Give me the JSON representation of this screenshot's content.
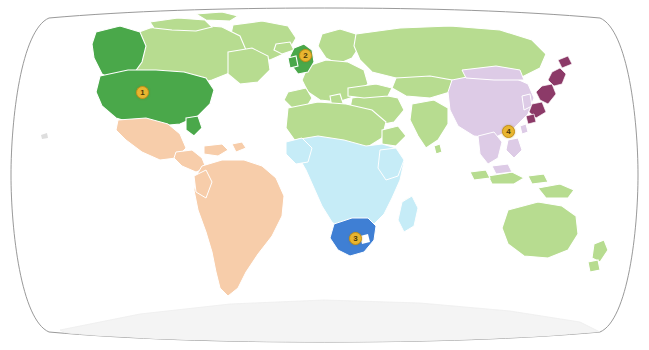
{
  "map": {
    "title": "World map with highlighted countries",
    "projection": "robinson",
    "background_color": "#ffffff",
    "graticule_outline_color": "#8d8d8d",
    "region_colors": {
      "light_green": "#b7dc90",
      "dark_green": "#4aa84a",
      "peach": "#f7cdaa",
      "light_blue": "#c6ecf7",
      "dark_blue": "#3f7fd4",
      "light_purple": "#ddcbe6",
      "dark_purple": "#8c3a68",
      "antarctica": "#f4f4f4",
      "border_color": "#ffffff"
    },
    "markers": [
      {
        "id": "marker-usa",
        "label": "1",
        "country": "United States",
        "x": 142,
        "y": 92,
        "highlight_color": "#4aa84a"
      },
      {
        "id": "marker-uk",
        "label": "2",
        "country": "United Kingdom",
        "x": 305,
        "y": 55,
        "highlight_color": "#4aa84a"
      },
      {
        "id": "marker-south-africa",
        "label": "3",
        "country": "South Africa",
        "x": 355,
        "y": 238,
        "highlight_color": "#3f7fd4"
      },
      {
        "id": "marker-philippines",
        "label": "4",
        "country": "Philippines",
        "x": 508,
        "y": 131,
        "highlight_color": "#e8b530"
      }
    ],
    "highlighted_regions": [
      {
        "name": "United States",
        "color": "#4aa84a"
      },
      {
        "name": "Canada (west)",
        "color": "#4aa84a"
      },
      {
        "name": "United Kingdom",
        "color": "#4aa84a"
      },
      {
        "name": "South Africa",
        "color": "#3f7fd4"
      },
      {
        "name": "Japan",
        "color": "#8c3a68"
      }
    ],
    "region_groups": [
      {
        "name": "Europe, Russia, North Africa, Australia, Canada east",
        "color": "#b7dc90"
      },
      {
        "name": "Latin America",
        "color": "#f7cdaa"
      },
      {
        "name": "Sub-Saharan Africa",
        "color": "#c6ecf7"
      },
      {
        "name": "China and East Asia",
        "color": "#ddcbe6"
      },
      {
        "name": "Antarctica",
        "color": "#f4f4f4"
      }
    ]
  }
}
